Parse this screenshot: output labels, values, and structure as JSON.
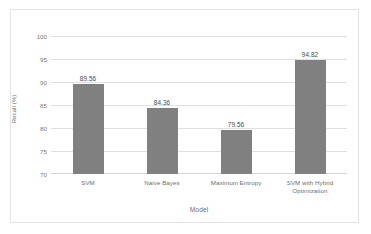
{
  "chart_data": {
    "type": "bar",
    "title": "",
    "categories": [
      "SVM",
      "Naive Bayes",
      "Maximum Entropy",
      "SVM with Hybrid Optimization"
    ],
    "category_lines": [
      [
        "SVM"
      ],
      [
        "Naive Bayes"
      ],
      [
        "Maximum Entropy"
      ],
      [
        "SVM with Hybrid",
        "Optimization"
      ]
    ],
    "values": [
      89.56,
      84.36,
      79.56,
      94.82
    ],
    "data_labels": [
      "89.56",
      "84.36",
      "79.56",
      "94.82"
    ],
    "xlabel": "Model",
    "ylabel": "Recall (%)",
    "ylim": [
      70,
      100
    ],
    "yticks": [
      100,
      95,
      90,
      85,
      80,
      75,
      70
    ],
    "ytick_labels": [
      "100",
      "95",
      "90",
      "85",
      "80",
      "75",
      "70"
    ],
    "grid": "horizontal",
    "legend": "none",
    "series_color": "#808080",
    "gridline_color": "#e0e0e0",
    "text_color": "#6e6e6e",
    "plot_background": "#ffffff",
    "border_color": "#e3e3e3"
  }
}
